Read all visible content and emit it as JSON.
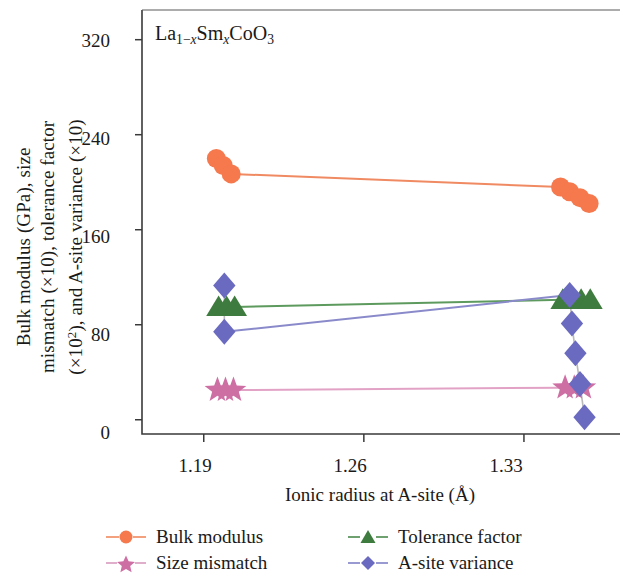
{
  "chart_data": {
    "type": "scatter",
    "title": "",
    "annotation": "La(1-x)Sm(x)CoO3",
    "xlabel": "Ionic radius at A-site (Å)",
    "ylabel": "Bulk modulus (GPa), size\nmismatch (×10), tolerance factor\n(×10²), and A-site variance (×10)",
    "xlim": [
      1.163,
      1.372
    ],
    "ylim": [
      -12,
      345
    ],
    "xticks": [
      1.19,
      1.26,
      1.33
    ],
    "xtick_labels": [
      "1.19",
      "1.26",
      "1.33"
    ],
    "yticks": [
      0,
      80,
      160,
      240,
      320
    ],
    "ytick_labels": [
      "0",
      "80",
      "160",
      "240",
      "320"
    ],
    "grid": false,
    "legend_position": "below",
    "series": [
      {
        "name": "Bulk modulus",
        "marker": "circle",
        "color": "#F5794D",
        "line_color": "#F08A62",
        "points": [
          {
            "x": 1.1955,
            "y": 220
          },
          {
            "x": 1.1985,
            "y": 214
          },
          {
            "x": 1.202,
            "y": 207
          },
          {
            "x": 1.346,
            "y": 196
          },
          {
            "x": 1.35,
            "y": 192
          },
          {
            "x": 1.3545,
            "y": 187
          },
          {
            "x": 1.3585,
            "y": 182
          }
        ]
      },
      {
        "name": "Tolerance factor",
        "marker": "triangle",
        "color": "#3E7B3E",
        "line_color": "#5D9A5D",
        "points": [
          {
            "x": 1.1965,
            "y": 95
          },
          {
            "x": 1.2,
            "y": 95
          },
          {
            "x": 1.2035,
            "y": 95
          },
          {
            "x": 1.347,
            "y": 101
          },
          {
            "x": 1.351,
            "y": 101
          },
          {
            "x": 1.355,
            "y": 101
          },
          {
            "x": 1.359,
            "y": 101
          }
        ]
      },
      {
        "name": "Size mismatch",
        "marker": "star",
        "color": "#CE6FA4",
        "line_color": "#E2A2C6",
        "points": [
          {
            "x": 1.196,
            "y": 25
          },
          {
            "x": 1.1995,
            "y": 25
          },
          {
            "x": 1.203,
            "y": 25
          },
          {
            "x": 1.348,
            "y": 27
          },
          {
            "x": 1.352,
            "y": 27
          },
          {
            "x": 1.356,
            "y": 27
          }
        ]
      },
      {
        "name": "A-site variance",
        "marker": "diamond",
        "color": "#6A6AC0",
        "line_color": "#8A8ACB",
        "points": [
          {
            "x": 1.199,
            "y": 113
          },
          {
            "x": 1.199,
            "y": 74
          },
          {
            "x": 1.35,
            "y": 105
          },
          {
            "x": 1.351,
            "y": 81
          },
          {
            "x": 1.3525,
            "y": 56
          },
          {
            "x": 1.3545,
            "y": 30
          },
          {
            "x": 1.3565,
            "y": 2
          }
        ],
        "trend_line": [
          {
            "x": 1.199,
            "y": 74
          },
          {
            "x": 1.35,
            "y": 105
          }
        ]
      }
    ],
    "legend": [
      {
        "label": "Bulk modulus",
        "marker": "circle",
        "color": "#F5794D",
        "line_color": "#F2A07E"
      },
      {
        "label": "Tolerance factor",
        "marker": "triangle",
        "color": "#3E7B3E",
        "line_color": "#6FA06F"
      },
      {
        "label": "Size mismatch",
        "marker": "star",
        "color": "#CE6FA4",
        "line_color": "#DFAECB"
      },
      {
        "label": "A-site variance",
        "marker": "diamond",
        "color": "#6A6AC0",
        "line_color": "#9A9AD2"
      }
    ]
  }
}
